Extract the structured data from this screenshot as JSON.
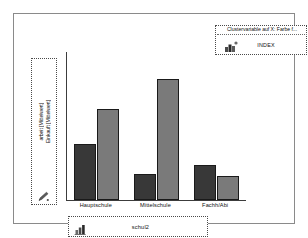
{
  "legend": {
    "title": "Clustervariable auf X: Farbe f...",
    "label": "INDEX",
    "icon": "cluster-color-icon"
  },
  "y_axis": {
    "label_primary": "arbeit [Mittelwert]",
    "label_secondary": "Einkauft [Mittelwert]",
    "icon": "pencil-icon"
  },
  "x_axis": {
    "variable_label": "schul2",
    "icon": "bar-chart-icon"
  },
  "colors": {
    "series_dark": "#383838",
    "series_light": "#7a7a7a",
    "bar_outline": "#1a1a1a",
    "axis": "#3c3c3c",
    "panel_border": "#8a8a8a",
    "box_border": "#4a4a4a",
    "background": "#ffffff"
  },
  "chart_data": {
    "type": "bar",
    "title": "",
    "xlabel": "schul2",
    "ylabel": "arbeit [Mittelwert] / Einkauft [Mittelwert]",
    "categories": [
      "Hauptschule",
      "Mittelschule",
      "Fachh/Abi"
    ],
    "series": [
      {
        "name": "arbeit [Mittelwert]",
        "color": "#383838",
        "values": [
          38,
          18,
          24
        ]
      },
      {
        "name": "Einkauft [Mittelwert]",
        "color": "#7a7a7a",
        "values": [
          62,
          82,
          16
        ]
      }
    ],
    "ylim": [
      0,
      100
    ],
    "grid": false,
    "legend_position": "top-right",
    "legend_entries": [
      "INDEX"
    ]
  }
}
